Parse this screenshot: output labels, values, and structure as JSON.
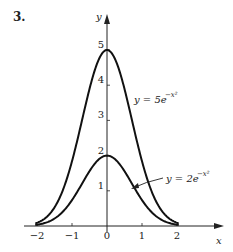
{
  "problem_number": "3.",
  "chart_data": {
    "type": "line",
    "title": "",
    "xlabel": "x",
    "ylabel": "y",
    "xlim": [
      -2.1,
      2.6
    ],
    "ylim": [
      0,
      5.4
    ],
    "x_ticks": [
      -2,
      -1,
      0,
      1,
      2
    ],
    "x_tick_labels": [
      "−2",
      "−1",
      "0",
      "1",
      "2"
    ],
    "y_ticks": [
      1,
      2,
      3,
      4,
      5
    ],
    "y_tick_labels": [
      "1",
      "2",
      "3",
      "4",
      "5"
    ],
    "grid": false,
    "legend": "none (curves labeled inline)",
    "series": [
      {
        "name": "y = 5e^{-x^2}",
        "label_text": "y = 5e",
        "label_exp": "−x²",
        "formula": "5*exp(-x^2)",
        "x": [
          -2,
          -1.5,
          -1,
          -0.5,
          0,
          0.5,
          1,
          1.5,
          2
        ],
        "values": [
          0.09,
          0.53,
          1.84,
          3.89,
          5,
          3.89,
          1.84,
          0.53,
          0.09
        ]
      },
      {
        "name": "y = 2e^{-x^2}",
        "label_text": "y = 2e",
        "label_exp": "−x²",
        "formula": "2*exp(-x^2)",
        "x": [
          -2,
          -1.5,
          -1,
          -0.5,
          0,
          0.5,
          1,
          1.5,
          2
        ],
        "values": [
          0.04,
          0.21,
          0.74,
          1.56,
          2,
          1.56,
          0.74,
          0.21,
          0.04
        ]
      }
    ],
    "annotations": [
      {
        "text": "y = 5e^{-x^2}",
        "position": "right of upper curve near y≈3.7"
      },
      {
        "text": "y = 2e^{-x^2}",
        "position": "right side with arrow pointing to lower curve near x≈0.7"
      }
    ]
  }
}
